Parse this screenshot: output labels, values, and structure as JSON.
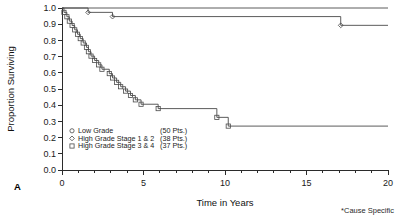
{
  "panel_label": "A",
  "footnote": "*Cause Specific",
  "chart_data": {
    "type": "line",
    "title": "",
    "xlabel": "Time in Years",
    "ylabel": "Proportion Surviving",
    "xlim": [
      0,
      20
    ],
    "ylim": [
      0.0,
      1.0
    ],
    "grid": false,
    "legend_position": "lower-left",
    "x_ticks": [
      0,
      5,
      10,
      15,
      20
    ],
    "x_tick_labels": [
      "0",
      "5",
      "10",
      "15",
      "20"
    ],
    "x_minor_ticks": [
      1,
      2,
      3,
      4,
      6,
      7,
      8,
      9,
      11,
      12,
      13,
      14,
      16,
      17,
      18,
      19
    ],
    "y_ticks": [
      0.0,
      0.1,
      0.2,
      0.3,
      0.4,
      0.5,
      0.6,
      0.7,
      0.8,
      0.9,
      1.0
    ],
    "y_tick_labels": [
      "0.0",
      "0.1",
      "0.2",
      "0.3",
      "0.4",
      "0.5",
      "0.6",
      "0.7",
      "0.8",
      "0.9",
      "1.0"
    ],
    "series": [
      {
        "name": "Low Grade",
        "count_label": "(50 Pts.)",
        "marker": "circle",
        "points": [
          [
            0.0,
            1.0
          ],
          [
            20.0,
            1.0
          ]
        ]
      },
      {
        "name": "High Grade Stage 1 & 2",
        "count_label": "(38 Pts.)",
        "marker": "diamond",
        "points": [
          [
            0.0,
            1.0
          ],
          [
            1.6,
            1.0
          ],
          [
            1.6,
            0.973
          ],
          [
            3.1,
            0.973
          ],
          [
            3.1,
            0.947
          ],
          [
            17.1,
            0.947
          ],
          [
            17.1,
            0.893
          ],
          [
            20.0,
            0.893
          ]
        ]
      },
      {
        "name": "High Grade Stage 3 & 4",
        "count_label": "(37 Pts.)",
        "marker": "square",
        "points": [
          [
            0.0,
            1.0
          ],
          [
            0.12,
            1.0
          ],
          [
            0.12,
            0.973
          ],
          [
            0.3,
            0.973
          ],
          [
            0.3,
            0.946
          ],
          [
            0.45,
            0.946
          ],
          [
            0.45,
            0.919
          ],
          [
            0.62,
            0.919
          ],
          [
            0.62,
            0.892
          ],
          [
            0.78,
            0.892
          ],
          [
            0.78,
            0.865
          ],
          [
            0.95,
            0.865
          ],
          [
            0.95,
            0.838
          ],
          [
            1.12,
            0.838
          ],
          [
            1.12,
            0.811
          ],
          [
            1.3,
            0.811
          ],
          [
            1.3,
            0.784
          ],
          [
            1.5,
            0.784
          ],
          [
            1.5,
            0.757
          ],
          [
            1.62,
            0.757
          ],
          [
            1.62,
            0.73
          ],
          [
            1.78,
            0.73
          ],
          [
            1.78,
            0.703
          ],
          [
            2.0,
            0.703
          ],
          [
            2.0,
            0.676
          ],
          [
            2.25,
            0.676
          ],
          [
            2.25,
            0.649
          ],
          [
            2.45,
            0.649
          ],
          [
            2.45,
            0.622
          ],
          [
            2.9,
            0.622
          ],
          [
            2.9,
            0.595
          ],
          [
            3.1,
            0.595
          ],
          [
            3.1,
            0.568
          ],
          [
            3.35,
            0.568
          ],
          [
            3.35,
            0.541
          ],
          [
            3.6,
            0.541
          ],
          [
            3.6,
            0.514
          ],
          [
            3.9,
            0.514
          ],
          [
            3.9,
            0.487
          ],
          [
            4.2,
            0.487
          ],
          [
            4.2,
            0.46
          ],
          [
            4.5,
            0.46
          ],
          [
            4.5,
            0.433
          ],
          [
            4.85,
            0.433
          ],
          [
            4.85,
            0.406
          ],
          [
            5.9,
            0.406
          ],
          [
            5.9,
            0.379
          ],
          [
            9.5,
            0.379
          ],
          [
            9.5,
            0.325
          ],
          [
            10.2,
            0.325
          ],
          [
            10.2,
            0.271
          ],
          [
            20.0,
            0.271
          ]
        ]
      }
    ]
  }
}
